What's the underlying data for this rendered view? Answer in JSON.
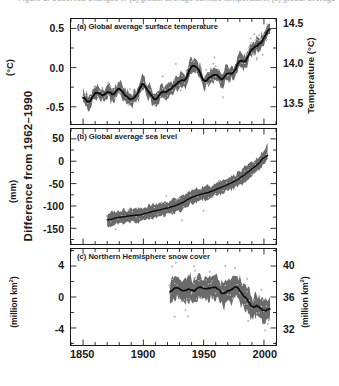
{
  "figure": {
    "caption_top": "Figure 1. Observed changes in (a) global average surface temperature, (b) global average sea level, and (c) Northern Hemisphere snow cover.",
    "outer_y_label": "Difference from 1962–1990",
    "x_axis": {
      "label": "",
      "ticks": [
        1850,
        1900,
        1950,
        2000
      ],
      "tick_labels": [
        "1850",
        "1900",
        "1950",
        "2000"
      ],
      "range": [
        1840,
        2010
      ],
      "minor_step": 10
    },
    "colors": {
      "line": "#111111",
      "band": "#555555",
      "axis": "#1a1a1a",
      "text": "#1a1a1a",
      "background": "#ffffff"
    }
  },
  "chart_data": [
    {
      "type": "line",
      "panel": "a",
      "title": "(a) Global average surface temperature",
      "xlabel": "",
      "ylabel": "(°C)",
      "ylabel_right": "Temperature (°C)",
      "ylim": [
        -0.72,
        0.62
      ],
      "yticks": [
        0.5,
        0.0,
        -0.5
      ],
      "ytick_labels": [
        "0.5",
        "0.0",
        "-0.5"
      ],
      "ylim_right": [
        13.22,
        14.56
      ],
      "yticks_right": [
        14.5,
        14.0,
        13.5
      ],
      "ytick_labels_right": [
        "14.5",
        "14.0",
        "13.5"
      ],
      "grid": false,
      "band_label": "uncertainty range",
      "band_halfwidth": 0.1,
      "x": [
        1850,
        1855,
        1860,
        1865,
        1870,
        1875,
        1880,
        1885,
        1890,
        1895,
        1900,
        1905,
        1910,
        1915,
        1920,
        1925,
        1930,
        1935,
        1940,
        1945,
        1950,
        1955,
        1960,
        1965,
        1970,
        1975,
        1980,
        1985,
        1990,
        1995,
        2000,
        2005
      ],
      "values": [
        -0.38,
        -0.44,
        -0.32,
        -0.36,
        -0.31,
        -0.34,
        -0.28,
        -0.37,
        -0.42,
        -0.34,
        -0.2,
        -0.32,
        -0.44,
        -0.32,
        -0.28,
        -0.24,
        -0.16,
        -0.17,
        0.04,
        0.0,
        -0.19,
        -0.14,
        -0.09,
        -0.15,
        -0.05,
        -0.1,
        0.08,
        0.07,
        0.25,
        0.29,
        0.35,
        0.52
      ]
    },
    {
      "type": "line",
      "panel": "b",
      "title": "(b) Global average sea level",
      "xlabel": "",
      "ylabel": "(mm)",
      "ylabel_right": "",
      "ylim": [
        -185,
        72
      ],
      "yticks": [
        50,
        0,
        -50,
        -100,
        -150
      ],
      "ytick_labels": [
        "50",
        "0",
        "-50",
        "-100",
        "-150"
      ],
      "grid": false,
      "band_halfwidth": 18,
      "x": [
        1870,
        1875,
        1880,
        1885,
        1890,
        1895,
        1900,
        1905,
        1910,
        1915,
        1920,
        1925,
        1930,
        1935,
        1940,
        1945,
        1950,
        1955,
        1960,
        1965,
        1970,
        1975,
        1980,
        1985,
        1990,
        1995,
        2000,
        2003
      ],
      "values": [
        -133,
        -128,
        -126,
        -124,
        -120,
        -122,
        -118,
        -114,
        -112,
        -108,
        -104,
        -100,
        -96,
        -88,
        -80,
        -76,
        -72,
        -70,
        -62,
        -58,
        -52,
        -46,
        -38,
        -28,
        -18,
        -6,
        8,
        24
      ]
    },
    {
      "type": "line",
      "panel": "c",
      "title": "(c) Northern Hemisphere snow cover",
      "xlabel": "",
      "ylabel": "(million km²)",
      "ylabel_right": "(million km²)",
      "ylim": [
        -6.2,
        6.2
      ],
      "yticks": [
        4,
        0,
        -4
      ],
      "ytick_labels": [
        "4",
        "0",
        "-4"
      ],
      "ylim_right": [
        29.8,
        42.2
      ],
      "yticks_right": [
        40,
        36,
        32
      ],
      "ytick_labels_right": [
        "40",
        "36",
        "32"
      ],
      "grid": false,
      "band_halfwidth": 1.6,
      "x": [
        1922,
        1926,
        1930,
        1934,
        1938,
        1942,
        1946,
        1950,
        1954,
        1958,
        1962,
        1966,
        1970,
        1974,
        1978,
        1982,
        1986,
        1990,
        1994,
        1998,
        2002,
        2005
      ],
      "values": [
        0.2,
        1.3,
        1.0,
        0.6,
        1.2,
        0.6,
        1.4,
        1.0,
        0.9,
        1.5,
        1.1,
        0.4,
        0.6,
        1.0,
        1.4,
        0.2,
        0.1,
        -1.6,
        -0.9,
        -1.3,
        -2.0,
        -1.4
      ]
    }
  ]
}
